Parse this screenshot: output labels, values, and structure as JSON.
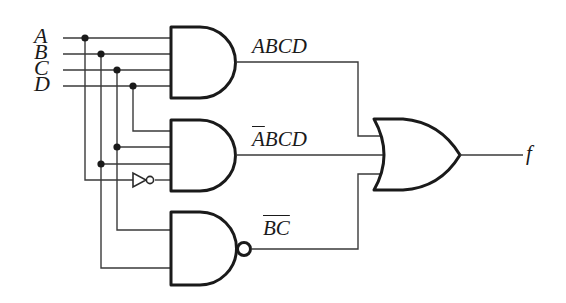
{
  "diagram": {
    "inputs": [
      {
        "label": "A"
      },
      {
        "label": "B"
      },
      {
        "label": "C"
      },
      {
        "label": "D"
      }
    ],
    "gates": [
      {
        "type": "AND",
        "output_label": "ABCD",
        "inputs": [
          "A",
          "B",
          "C",
          "D"
        ]
      },
      {
        "type": "AND",
        "output_label_bar": "A",
        "output_label_rest": "BCD",
        "output_label": "A̅BCD",
        "inputs": [
          "D",
          "C",
          "B",
          "NOT A"
        ]
      },
      {
        "type": "NAND",
        "output_label_bar": "BC",
        "output_label": "B̅C̅ (complement of BC)",
        "inputs": [
          "C",
          "B"
        ]
      },
      {
        "type": "OR",
        "inputs": [
          "ABCD",
          "A̅BCD",
          "complement of BC"
        ],
        "output_label": "f"
      },
      {
        "type": "NOT",
        "inputs": [
          "A"
        ]
      }
    ],
    "output": {
      "label": "f"
    },
    "colors": {
      "ink": "#1a1a1a",
      "wire": "#3a3a3a",
      "background": "#ffffff"
    }
  }
}
